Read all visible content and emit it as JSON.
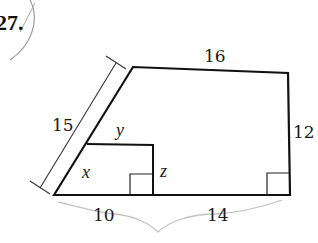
{
  "problem": {
    "number": "27."
  },
  "figure": {
    "stroke_color": "#111111",
    "pencil_color": "#b8b8b8",
    "side_labels": {
      "top": "16",
      "right": "12",
      "slant": "15",
      "bottom_left": "10",
      "bottom_right": "14"
    },
    "variable_labels": {
      "inner_top": "y",
      "inner_slant": "x",
      "inner_vertical": "z"
    }
  }
}
